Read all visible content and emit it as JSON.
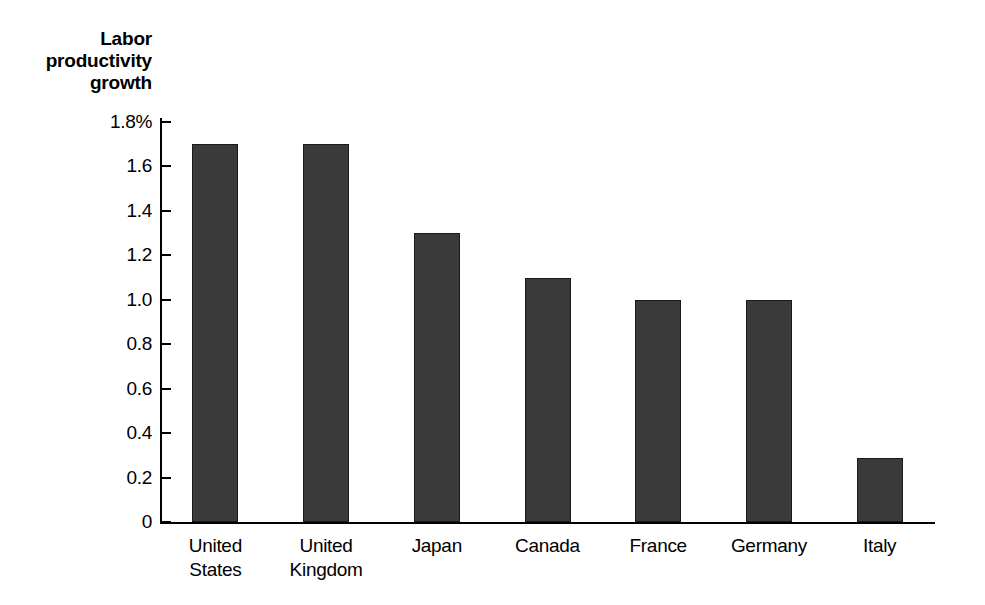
{
  "chart_data": {
    "type": "bar",
    "title": "",
    "ylabel": "Labor productivity growth",
    "xlabel": "",
    "categories": [
      "United States",
      "United Kingdom",
      "Japan",
      "Canada",
      "France",
      "Germany",
      "Italy"
    ],
    "values": [
      1.7,
      1.7,
      1.3,
      1.1,
      1.0,
      1.0,
      0.29
    ],
    "ylim": [
      0,
      1.8
    ],
    "ytick_labels": [
      "1.8%",
      "1.6",
      "1.4",
      "1.2",
      "1.0",
      "0.8",
      "0.6",
      "0.4",
      "0.2",
      "0"
    ],
    "ytick_values": [
      1.8,
      1.6,
      1.4,
      1.2,
      1.0,
      0.8,
      0.6,
      0.4,
      0.2,
      0
    ],
    "grid": false,
    "legend": null,
    "bar_color": "#3a3a3a",
    "axis_color": "#000000",
    "background_color": "#ffffff"
  },
  "axis_title": {
    "line1": "Labor",
    "line2": "productivity",
    "line3": "growth"
  }
}
